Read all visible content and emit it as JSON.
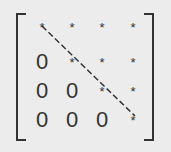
{
  "matrix": {
    "type": "upper-triangular",
    "rows": [
      [
        "*",
        "*",
        "*",
        "*"
      ],
      [
        "0",
        "*",
        "*",
        "*"
      ],
      [
        "0",
        "0",
        "*",
        "*"
      ],
      [
        "0",
        "0",
        "0",
        "*"
      ]
    ],
    "diagonal_line": "dashed",
    "colors": {
      "background": "#ececec",
      "ink": "#333333"
    }
  }
}
